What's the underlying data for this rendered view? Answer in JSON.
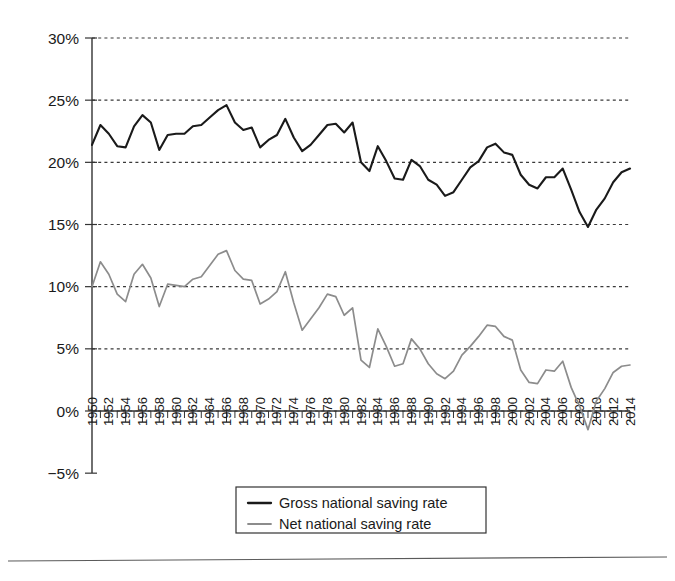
{
  "chart_data": {
    "type": "line",
    "title": "",
    "xlabel": "",
    "ylabel": "",
    "xlim": [
      1950,
      2014
    ],
    "ylim": [
      -5,
      30
    ],
    "grid": true,
    "legend_position": "bottom-center",
    "ytick_labels": [
      "30%",
      "25%",
      "20%",
      "15%",
      "10%",
      "5%",
      "0%",
      "−5%"
    ],
    "ytick_values": [
      30,
      25,
      20,
      15,
      10,
      5,
      0,
      -5
    ],
    "xtick_labels": [
      "1950",
      "1952",
      "1954",
      "1956",
      "1958",
      "1960",
      "1962",
      "1964",
      "1966",
      "1968",
      "1970",
      "1972",
      "1974",
      "1976",
      "1978",
      "1980",
      "1982",
      "1984",
      "1986",
      "1988",
      "1990",
      "1992",
      "1994",
      "1996",
      "1998",
      "2000",
      "2002",
      "2004",
      "2006",
      "2008",
      "2010",
      "2012",
      "2014"
    ],
    "x": [
      1950,
      1951,
      1952,
      1953,
      1954,
      1955,
      1956,
      1957,
      1958,
      1959,
      1960,
      1961,
      1962,
      1963,
      1964,
      1965,
      1966,
      1967,
      1968,
      1969,
      1970,
      1971,
      1972,
      1973,
      1974,
      1975,
      1976,
      1977,
      1978,
      1979,
      1980,
      1981,
      1982,
      1983,
      1984,
      1985,
      1986,
      1987,
      1988,
      1989,
      1990,
      1991,
      1992,
      1993,
      1994,
      1995,
      1996,
      1997,
      1998,
      1999,
      2000,
      2001,
      2002,
      2003,
      2004,
      2005,
      2006,
      2007,
      2008,
      2009,
      2010,
      2011,
      2012,
      2013,
      2014
    ],
    "series": [
      {
        "name": "Gross national saving rate",
        "color": "#1a1a1a",
        "values": [
          21.4,
          23.0,
          22.3,
          21.3,
          21.2,
          22.9,
          23.8,
          23.2,
          21.0,
          22.2,
          22.3,
          22.3,
          22.9,
          23.0,
          23.6,
          24.2,
          24.6,
          23.2,
          22.6,
          22.8,
          21.2,
          21.8,
          22.2,
          23.5,
          22.0,
          20.9,
          21.4,
          22.2,
          23.0,
          23.1,
          22.4,
          23.2,
          20.0,
          19.3,
          21.3,
          20.1,
          18.7,
          18.6,
          20.2,
          19.7,
          18.6,
          18.2,
          17.3,
          17.6,
          18.6,
          19.6,
          20.1,
          21.2,
          21.5,
          20.8,
          20.6,
          19.0,
          18.2,
          17.9,
          18.8,
          18.8,
          19.5,
          17.8,
          16.0,
          14.8,
          16.2,
          17.1,
          18.4,
          19.2,
          19.5
        ]
      },
      {
        "name": "Net national saving rate",
        "color": "#8c8c8c",
        "values": [
          10.0,
          12.0,
          11.0,
          9.4,
          8.8,
          11.0,
          11.8,
          10.7,
          8.4,
          10.2,
          10.1,
          10.0,
          10.6,
          10.8,
          11.7,
          12.6,
          12.9,
          11.3,
          10.6,
          10.5,
          8.6,
          9.0,
          9.6,
          11.2,
          8.7,
          6.5,
          7.4,
          8.3,
          9.4,
          9.2,
          7.7,
          8.3,
          4.1,
          3.5,
          6.6,
          5.2,
          3.6,
          3.8,
          5.8,
          5.0,
          3.8,
          3.0,
          2.6,
          3.2,
          4.5,
          5.2,
          6.0,
          6.9,
          6.8,
          6.0,
          5.7,
          3.3,
          2.3,
          2.2,
          3.3,
          3.2,
          4.0,
          1.9,
          0.4,
          -1.5,
          0.8,
          1.8,
          3.1,
          3.6,
          3.7
        ]
      }
    ]
  },
  "legend": {
    "entries": [
      {
        "label": "Gross national saving rate",
        "color": "#1a1a1a"
      },
      {
        "label": "Net national saving rate",
        "color": "#8c8c8c"
      }
    ]
  }
}
